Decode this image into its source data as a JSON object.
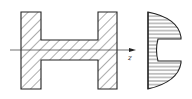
{
  "diagram": {
    "type": "beam-cross-section-shear-stress",
    "cross_section": {
      "shape": "I-section (flanges vertical)",
      "hatching": "diagonal",
      "stroke_color": "#222222"
    },
    "axis": {
      "label": "z",
      "direction": "right"
    },
    "stress_distribution": {
      "shape": "parabolic with step at flange-web junction",
      "hatching": "horizontal",
      "stroke_color": "#222222"
    }
  }
}
